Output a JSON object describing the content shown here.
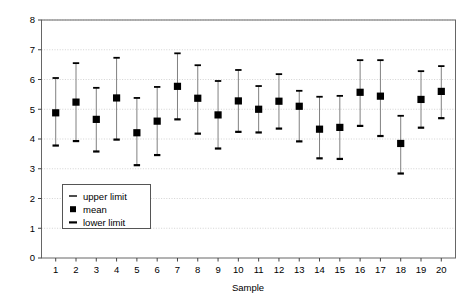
{
  "chart_data": {
    "type": "scatter",
    "title": "",
    "subtitle": "",
    "xlabel": "Sample",
    "ylabel": "",
    "xlim": [
      0.3,
      20.7
    ],
    "ylim": [
      0,
      8
    ],
    "grid": true,
    "grid_style": "dotted",
    "legend_position": "inside-lower-left",
    "categories": [
      "1",
      "2",
      "3",
      "4",
      "5",
      "6",
      "7",
      "8",
      "9",
      "10",
      "11",
      "12",
      "13",
      "14",
      "15",
      "16",
      "17",
      "18",
      "19",
      "20"
    ],
    "x_tick_labels": [
      "1",
      "2",
      "3",
      "4",
      "5",
      "6",
      "7",
      "8",
      "9",
      "10",
      "11",
      "12",
      "13",
      "14",
      "15",
      "16",
      "17",
      "18",
      "19",
      "20"
    ],
    "y_tick_labels": [
      "0",
      "1",
      "2",
      "3",
      "4",
      "5",
      "6",
      "7",
      "8"
    ],
    "y_ticks": [
      0,
      1,
      2,
      3,
      4,
      5,
      6,
      7,
      8
    ],
    "series": [
      {
        "name": "upper limit",
        "marker": "dash",
        "color": "#000000",
        "values": [
          6.05,
          6.55,
          5.72,
          6.73,
          5.38,
          5.75,
          6.88,
          6.48,
          5.95,
          6.32,
          5.78,
          6.18,
          5.62,
          5.42,
          5.45,
          6.65,
          6.65,
          4.78,
          6.28,
          6.45
        ]
      },
      {
        "name": "mean",
        "marker": "square",
        "color": "#000000",
        "values": [
          4.88,
          5.24,
          4.66,
          5.38,
          4.21,
          4.6,
          5.77,
          5.37,
          4.81,
          5.28,
          5.0,
          5.27,
          5.1,
          4.33,
          4.39,
          5.57,
          5.44,
          3.85,
          5.33,
          5.6
        ]
      },
      {
        "name": "lower limit",
        "marker": "dash",
        "color": "#000000",
        "values": [
          3.78,
          3.93,
          3.58,
          3.98,
          3.12,
          3.46,
          4.66,
          4.18,
          3.68,
          4.24,
          4.22,
          4.35,
          3.92,
          3.35,
          3.33,
          4.44,
          4.1,
          2.84,
          4.38,
          4.7
        ]
      }
    ]
  },
  "legend": {
    "items": [
      {
        "label": "upper limit",
        "marker": "dash"
      },
      {
        "label": "mean",
        "marker": "square"
      },
      {
        "label": "lower limit",
        "marker": "dash-bold"
      }
    ]
  },
  "axes": {
    "x_title": "Sample",
    "y_title": ""
  },
  "colors": {
    "marker": "#000000",
    "line": "#808080",
    "grid": "#c8c8c8",
    "frame": "#666666",
    "background": "#ffffff"
  }
}
